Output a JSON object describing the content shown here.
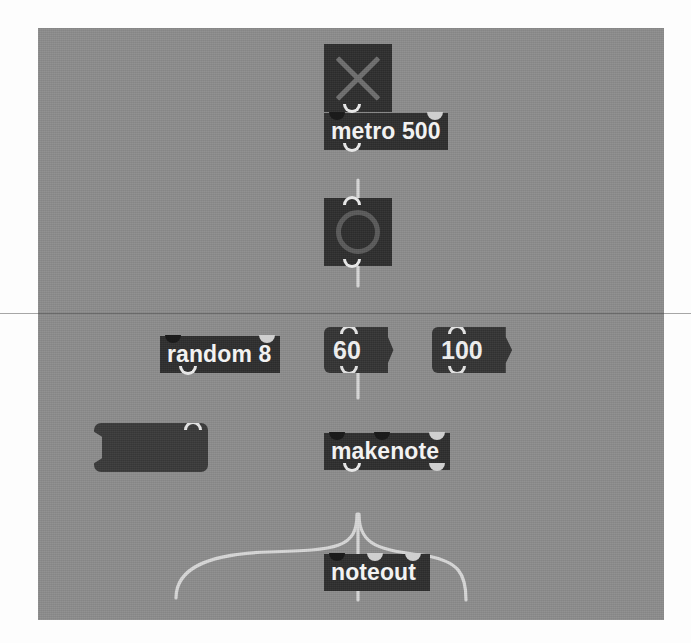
{
  "app": {
    "name": "Max patcher window",
    "canvas_bg_color": "#8d8d8d",
    "object_box_color": "#2e2e2e",
    "object_text_color": "#f2f2f2",
    "cord_color": "#d8d8d8"
  },
  "objects": {
    "toggle": {
      "name": "toggle",
      "state": "on",
      "mark": "x",
      "inlets": 1,
      "outlets": 1
    },
    "metro": {
      "text": "metro 500",
      "inlets": 2,
      "outlets": 1
    },
    "bang": {
      "name": "bang",
      "inlets": 1,
      "outlets": 1
    },
    "random": {
      "text": "random 8",
      "inlets": 2,
      "outlets": 1
    },
    "message_empty": {
      "text": "",
      "inlets": 1,
      "outlets": 1
    },
    "number_pitch": {
      "value": "60",
      "inlets": 1,
      "outlets": 1
    },
    "number_velocity": {
      "value": "100",
      "inlets": 1,
      "outlets": 1
    },
    "makenote": {
      "text": "makenote",
      "inlets": 3,
      "outlets": 2
    },
    "noteout": {
      "text": "noteout",
      "inlets": 3,
      "outlets": 0
    }
  }
}
